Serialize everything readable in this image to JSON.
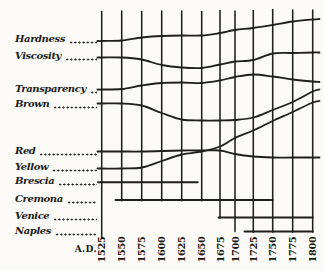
{
  "axis": {
    "ad_label": "A.D."
  },
  "left_labels": [
    {
      "text": "Hardness",
      "y": 40,
      "kind": "property"
    },
    {
      "text": "Viscosity",
      "y": 57,
      "kind": "property"
    },
    {
      "text": "Transparency",
      "y": 90,
      "kind": "property"
    },
    {
      "text": "Brown",
      "y": 104.5,
      "kind": "property"
    },
    {
      "text": "Red",
      "y": 151.5,
      "kind": "property"
    },
    {
      "text": "Yellow",
      "y": 168,
      "kind": "property"
    },
    {
      "text": "Brescia",
      "y": 182,
      "kind": "school"
    },
    {
      "text": "Cremona",
      "y": 199.5,
      "kind": "school"
    },
    {
      "text": "Venice",
      "y": 216.5,
      "kind": "school"
    },
    {
      "text": "Naples",
      "y": 231.5,
      "kind": "school"
    }
  ],
  "chart_data": {
    "type": "line",
    "coordinate_note": "y values are pixel positions in the 324x271 figure (no numeric vertical axis in original; curves are qualitative)",
    "grid": "vertical-only",
    "ink_color": "#201f1c",
    "paper_color": "#fbfaf6",
    "years": [
      1525,
      1550,
      1575,
      1600,
      1625,
      1650,
      1675,
      1700,
      1725,
      1750,
      1775,
      1800
    ],
    "columns": [
      {
        "year": "1525",
        "x": 101.7,
        "y_top": 11.5,
        "y_bottom": 237.5
      },
      {
        "year": "1550",
        "x": 121.7,
        "y_top": 11,
        "y_bottom": 200.8
      },
      {
        "year": "1575",
        "x": 141.7,
        "y_top": 11.5,
        "y_bottom": 200.8
      },
      {
        "year": "1600",
        "x": 161.7,
        "y_top": 11,
        "y_bottom": 200.8
      },
      {
        "year": "1625",
        "x": 181.7,
        "y_top": 11,
        "y_bottom": 200.8
      },
      {
        "year": "1650",
        "x": 201.7,
        "y_top": 11.5,
        "y_bottom": 200.8
      },
      {
        "year": "1675",
        "x": 220,
        "y_top": 10.5,
        "y_bottom": 218
      },
      {
        "year": "1700",
        "x": 235,
        "y_top": 11,
        "y_bottom": 231.5
      },
      {
        "year": "1725",
        "x": 253.3,
        "y_top": 10.5,
        "y_bottom": 232.3
      },
      {
        "year": "1750",
        "x": 272.7,
        "y_top": 9.5,
        "y_bottom": 232.3
      },
      {
        "year": "1775",
        "x": 292.7,
        "y_top": 10,
        "y_bottom": 232.3
      },
      {
        "year": "1800",
        "x": 312.7,
        "y_top": 10,
        "y_bottom": 232.3
      }
    ],
    "series": [
      {
        "name": "Hardness",
        "points": [
          [
            97.5,
            41
          ],
          [
            101.7,
            41
          ],
          [
            121.7,
            40.5
          ],
          [
            141.7,
            37.5
          ],
          [
            161.7,
            36
          ],
          [
            181.7,
            35.5
          ],
          [
            201.7,
            35.5
          ],
          [
            220,
            33
          ],
          [
            235,
            30
          ],
          [
            253.3,
            28
          ],
          [
            272.7,
            25
          ],
          [
            292.7,
            21.5
          ],
          [
            312.7,
            19.5
          ],
          [
            319.5,
            19
          ]
        ]
      },
      {
        "name": "Viscosity",
        "points": [
          [
            97.5,
            57.5
          ],
          [
            101.7,
            57.5
          ],
          [
            121.7,
            57.5
          ],
          [
            141.7,
            59.5
          ],
          [
            161.7,
            65
          ],
          [
            181.7,
            67.5
          ],
          [
            201.7,
            68
          ],
          [
            220,
            64.5
          ],
          [
            235,
            61.5
          ],
          [
            253.3,
            60
          ],
          [
            272.7,
            53.5
          ],
          [
            292.7,
            53
          ],
          [
            312.7,
            52.5
          ],
          [
            319.5,
            52.5
          ]
        ]
      },
      {
        "name": "Transparency",
        "points": [
          [
            97.5,
            89.5
          ],
          [
            101.7,
            89.5
          ],
          [
            121.7,
            89
          ],
          [
            141.7,
            85.5
          ],
          [
            161.7,
            83
          ],
          [
            181.7,
            82.5
          ],
          [
            201.7,
            83
          ],
          [
            220,
            80.5
          ],
          [
            235,
            77
          ],
          [
            253.3,
            74.5
          ],
          [
            272.7,
            76.5
          ],
          [
            292.7,
            79.5
          ],
          [
            312.7,
            81.5
          ],
          [
            319.5,
            82
          ]
        ]
      },
      {
        "name": "Brown",
        "points": [
          [
            97.5,
            103.5
          ],
          [
            101.7,
            103.5
          ],
          [
            121.7,
            103.5
          ],
          [
            141.7,
            105.5
          ],
          [
            161.7,
            113
          ],
          [
            181.7,
            119.5
          ],
          [
            201.7,
            120.5
          ],
          [
            220,
            120.5
          ],
          [
            235,
            120
          ],
          [
            253.3,
            117.5
          ],
          [
            272.7,
            110
          ],
          [
            292.7,
            102
          ],
          [
            312.7,
            91.5
          ],
          [
            319.5,
            89.5
          ]
        ]
      },
      {
        "name": "Red",
        "points": [
          [
            97.5,
            151.5
          ],
          [
            101.7,
            151.5
          ],
          [
            121.7,
            151.5
          ],
          [
            141.7,
            151.5
          ],
          [
            161.7,
            151
          ],
          [
            181.7,
            150.5
          ],
          [
            201.7,
            150.5
          ],
          [
            220,
            150.5
          ],
          [
            235,
            154
          ],
          [
            253.3,
            156.5
          ],
          [
            272.7,
            157.5
          ],
          [
            292.7,
            157.5
          ],
          [
            312.7,
            157.5
          ],
          [
            319.5,
            157.5
          ]
        ]
      },
      {
        "name": "Yellow",
        "points": [
          [
            97.5,
            168.5
          ],
          [
            101.7,
            168.5
          ],
          [
            121.7,
            168.5
          ],
          [
            141.7,
            167.5
          ],
          [
            161.7,
            161
          ],
          [
            181.7,
            154.5
          ],
          [
            201.7,
            151.5
          ],
          [
            220,
            146.5
          ],
          [
            235,
            138
          ],
          [
            253.3,
            130.5
          ],
          [
            272.7,
            121
          ],
          [
            292.7,
            112
          ],
          [
            312.7,
            102.5
          ],
          [
            319.5,
            101
          ]
        ]
      }
    ],
    "school_spans": [
      {
        "name": "Brescia",
        "y": 182.3,
        "x1": 98,
        "x2": 197.7
      },
      {
        "name": "Cremona",
        "y": 200,
        "x1": 115.5,
        "x2": 272.7
      },
      {
        "name": "Venice",
        "y": 217.5,
        "x1": 218.5,
        "x2": 312.7
      },
      {
        "name": "Naples",
        "y": 231.5,
        "x1": 244.5,
        "x2": 312.7
      }
    ]
  }
}
